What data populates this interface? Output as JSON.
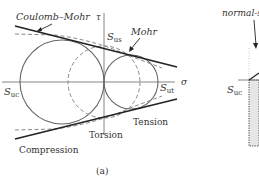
{
  "figure": {
    "caption": "(a)",
    "axes": {
      "x_label": "σ",
      "y_label": "τ"
    },
    "labels": {
      "coulomb_mohr": "Coulomb–Mohr",
      "mohr": "Mohr",
      "s_us_main": "S",
      "s_us_sub": "us",
      "s_uc_main": "S",
      "s_uc_sub": "uc",
      "s_ut_main": "S",
      "s_ut_sub": "ut",
      "torsion": "Torsion",
      "tension": "Tension",
      "compression": "Compression"
    },
    "circles": [
      {
        "name": "Compression",
        "style": "solid"
      },
      {
        "name": "Tension",
        "style": "solid"
      },
      {
        "name": "Torsion",
        "style": "dashed"
      }
    ]
  },
  "side_panel": {
    "label": "normal-s",
    "s_uc_main": "S",
    "s_uc_sub": "uc"
  },
  "colors": {
    "line": "#222222",
    "circle": "#666666",
    "dashed": "#888888",
    "shaded": "#e6e6e6"
  }
}
